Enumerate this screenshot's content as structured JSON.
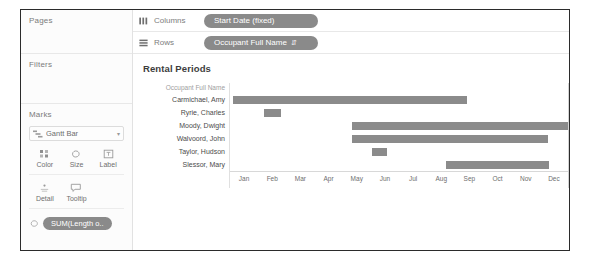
{
  "left_panel": {
    "pages_title": "Pages",
    "filters_title": "Filters",
    "marks_title": "Marks",
    "mark_type": "Gantt Bar",
    "mark_type_icon": "gantt-bar-icon",
    "caret_glyph": "▾",
    "properties": [
      {
        "label": "Color",
        "icon": "color-icon"
      },
      {
        "label": "Size",
        "icon": "size-icon"
      },
      {
        "label": "Label",
        "icon": "label-icon"
      },
      {
        "label": "Detail",
        "icon": "detail-icon"
      },
      {
        "label": "Tooltip",
        "icon": "tooltip-icon"
      }
    ],
    "marks_pill": "SUM(Length o..",
    "marks_pill_icon": "size-icon"
  },
  "shelves": {
    "columns": {
      "label": "Columns",
      "icon": "columns-icon",
      "pill": "Start Date (fixed)"
    },
    "rows": {
      "label": "Rows",
      "icon": "rows-icon",
      "pill": "Occupant Full Name",
      "pill_sort_icon": "sort-ascending-icon",
      "pill_sort_glyph": "⇵"
    }
  },
  "viz": {
    "title": "Rental Periods",
    "row_caption": "Occupant Full Name"
  },
  "chart_data": {
    "type": "bar",
    "title": "Rental Periods",
    "xlabel": "",
    "ylabel": "Occupant Full Name",
    "orientation": "horizontal",
    "grid": false,
    "legend": "none",
    "x_tick_labels": [
      "Jan",
      "Feb",
      "Mar",
      "Apr",
      "May",
      "Jun",
      "Jul",
      "Aug",
      "Sep",
      "Oct",
      "Nov",
      "Dec"
    ],
    "x_axis_type": "month-of-year",
    "bar_color": "#8b8b8b",
    "categories": [
      "Carmichael, Amy",
      "Ryrie, Charles",
      "Moody, Dwight",
      "Walvoord, John",
      "Taylor, Hudson",
      "Slessor, Mary"
    ],
    "bars": [
      {
        "category": "Carmichael, Amy",
        "start_month": 1.1,
        "end_month": 9.2,
        "start_pct": 1.0,
        "width_pct": 69.0
      },
      {
        "category": "Ryrie, Charles",
        "start_month": 2.2,
        "end_month": 3.0,
        "start_pct": 10.2,
        "width_pct": 5.0
      },
      {
        "category": "Moody, Dwight",
        "start_month": 5.2,
        "end_month": 12.9,
        "start_pct": 36.0,
        "width_pct": 64.0
      },
      {
        "category": "Walvoord, John",
        "start_month": 5.2,
        "end_month": 12.2,
        "start_pct": 36.0,
        "width_pct": 58.0
      },
      {
        "category": "Taylor, Hudson",
        "start_month": 6.0,
        "end_month": 6.7,
        "start_pct": 42.0,
        "width_pct": 4.5
      },
      {
        "category": "Slessor, Mary",
        "start_month": 8.3,
        "end_month": 11.9,
        "start_pct": 64.0,
        "width_pct": 30.5
      }
    ]
  }
}
